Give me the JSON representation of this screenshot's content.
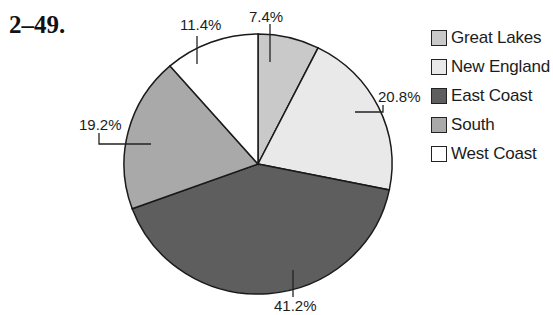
{
  "problem": {
    "number": "2–49."
  },
  "chart_data": {
    "type": "pie",
    "title": "",
    "categories": [
      "Great Lakes",
      "New England",
      "East Coast",
      "South",
      "West Coast"
    ],
    "values": [
      7.4,
      20.8,
      41.2,
      19.2,
      11.4
    ],
    "value_labels": [
      "7.4%",
      "20.8%",
      "41.2%",
      "19.2%",
      "11.4%"
    ],
    "colors": [
      "#c9c9c9",
      "#e9e9e9",
      "#5e5e5e",
      "#a9a9a9",
      "#ffffff"
    ],
    "start_angle_deg": 0,
    "direction": "clockwise",
    "legend_position": "right",
    "unit": "%"
  },
  "legend": {
    "items": [
      {
        "label": "Great Lakes",
        "color": "#c9c9c9"
      },
      {
        "label": "New England",
        "color": "#e9e9e9"
      },
      {
        "label": "East Coast",
        "color": "#5e5e5e"
      },
      {
        "label": "South",
        "color": "#a9a9a9"
      },
      {
        "label": "West Coast",
        "color": "#ffffff"
      }
    ]
  }
}
